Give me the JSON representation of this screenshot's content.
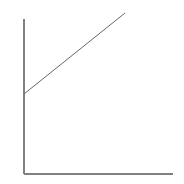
{
  "figure": {
    "width": 184,
    "height": 184,
    "background_color": "#ffffff"
  },
  "chart_data": {
    "type": "line",
    "title": "",
    "subtitle": "",
    "xlabel": "",
    "ylabel": "",
    "legend": [],
    "legend_position": "none",
    "grid": false,
    "tick_labels_x": [],
    "tick_labels_y": [],
    "xlim": [
      0,
      1
    ],
    "ylim": [
      0,
      1
    ],
    "series": [
      {
        "name": "trend",
        "color": "#666666",
        "line_width": 1,
        "style": "solid",
        "x": [
          0,
          1
        ],
        "y": [
          0.516,
          1.039
        ],
        "points_px": [
          {
            "x": 24,
            "y": 94
          },
          {
            "x": 125,
            "y": 13
          }
        ]
      }
    ]
  },
  "axes": {
    "color": "#808080",
    "line_width": 2,
    "y_axis": {
      "name": "vertical-axis",
      "x": 24,
      "y_top": 19,
      "y_bottom": 174
    },
    "x_axis": {
      "name": "horizontal-axis",
      "y": 174,
      "x_left": 24,
      "x_right": 173
    }
  }
}
